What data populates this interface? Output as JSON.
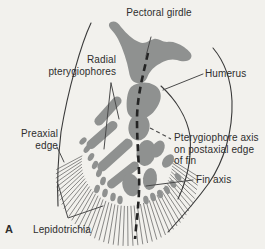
{
  "figure": {
    "panel_letter": "A",
    "labels": {
      "pectoral_girdle": "Pectoral girdle",
      "radial_pterygiophores": "Radial pterygiophores",
      "humerus": "Humerus",
      "preaxial_edge": "Preaxial edge",
      "pterygiophore_axis": "Pterygiophore axis on postaxial edge of fin",
      "fin_axis": "Fin axis",
      "lepidotrichia": "Lepidotrichia"
    },
    "colors": {
      "cartilage_gray": "#8f9190",
      "background": "#f2f1ed",
      "line": "#3a3a3a",
      "text": "#2e2e2e"
    }
  }
}
